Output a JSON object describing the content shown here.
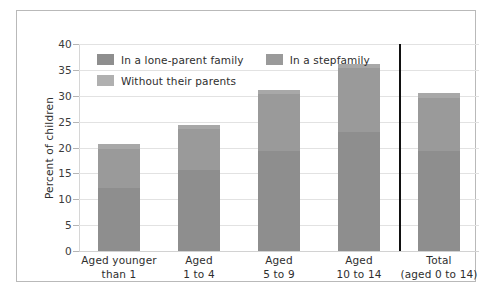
{
  "chart_data": {
    "type": "bar",
    "subtype": "stacked-bar",
    "title": "",
    "xlabel": "",
    "ylabel": "Percent of children",
    "ylim": [
      0,
      40
    ],
    "ytick_step": 5,
    "yticks": [
      "40",
      "35",
      "30",
      "25",
      "20",
      "15",
      "10",
      "5",
      "0"
    ],
    "grid": true,
    "legend_position": "upper-left-inside",
    "categories": [
      "Aged younger\nthan 1",
      "Aged\n1 to 4",
      "Aged\n5 to 9",
      "Aged\n10 to 14",
      "Total\n(aged 0 to 14)"
    ],
    "series": [
      {
        "name": "In a lone-parent family",
        "color": "#8e8e8e",
        "values": [
          12.2,
          15.6,
          19.4,
          23.0,
          19.3
        ]
      },
      {
        "name": "In a stepfamily",
        "color": "#9a9a9a",
        "values": [
          7.6,
          7.9,
          10.9,
          12.3,
          10.3
        ]
      },
      {
        "name": "Without their parents",
        "color": "#a8a8a8",
        "values": [
          0.9,
          0.9,
          0.9,
          0.9,
          0.9
        ]
      }
    ],
    "totals": [
      20.7,
      24.4,
      31.2,
      36.2,
      30.5
    ],
    "annotations": [
      {
        "type": "vertical-rule",
        "description": "separator before Total category",
        "color": "#111111"
      }
    ]
  },
  "legend": {
    "items": [
      {
        "label": "In a lone-parent family",
        "color": "#8e8e8e"
      },
      {
        "label": "In a stepfamily",
        "color": "#9a9a9a"
      },
      {
        "label": "Without their parents",
        "color": "#b0b0b0"
      }
    ]
  },
  "axis": {
    "y_title": "Percent of children"
  },
  "colors": {
    "frame_border": "#b9b9b9",
    "gridline": "#e2e2e2",
    "separator": "#111111",
    "text": "#2e2e2e",
    "background": "#ffffff"
  }
}
